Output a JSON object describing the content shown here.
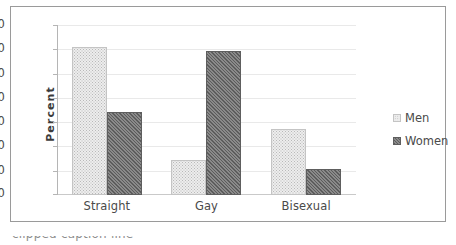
{
  "chart_data": {
    "type": "bar",
    "title": "",
    "xlabel": "",
    "ylabel": "Percent",
    "categories": [
      "Straight",
      "Gay",
      "Bisexual"
    ],
    "series": [
      {
        "name": "Men",
        "values": [
          61.5,
          14.7,
          27.2
        ],
        "swatch": "light-dotted"
      },
      {
        "name": "Women",
        "values": [
          34.4,
          59.8,
          10.9
        ],
        "swatch": "dark-hatched"
      }
    ],
    "ylim": [
      0,
      70
    ],
    "yticks": [
      70,
      60,
      50,
      40,
      30,
      20,
      10,
      0
    ],
    "grid": true,
    "legend_position": "right",
    "colors": {
      "men_fill": "#ededed",
      "men_pattern": "#b9b9b9",
      "women_fill": "#767676",
      "women_pattern": "#5c5c5c",
      "gridline": "#e9e9e9",
      "axis": "#b5b5b5",
      "frame": "#9a9a9a",
      "text": "#4a4a4a"
    }
  },
  "legend": {
    "items": [
      {
        "label": "Men"
      },
      {
        "label": "Women"
      }
    ]
  },
  "caption": {
    "text": "clipped caption line"
  }
}
